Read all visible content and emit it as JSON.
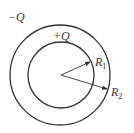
{
  "diagram": {
    "type": "concentric spherical shells",
    "center": {
      "x": 61,
      "y": 75
    },
    "outer_shell": {
      "charge_label": "−Q",
      "radius_px": 50,
      "radius_label": "R",
      "radius_subscript": "2"
    },
    "inner_shell": {
      "charge_label": "+Q",
      "radius_px": 33,
      "radius_label": "R",
      "radius_subscript": "1"
    },
    "colors": {
      "line": "#333333",
      "background": "#ffffff"
    }
  }
}
